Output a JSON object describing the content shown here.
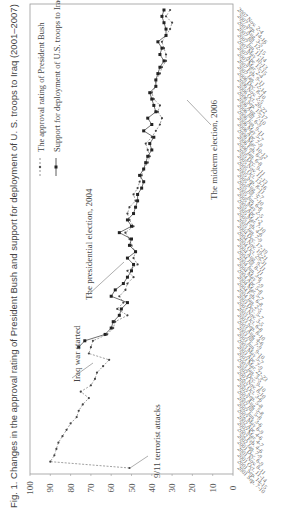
{
  "chart_data": {
    "type": "line",
    "title": "Fig. 1. Changes in the approval rating of President Bush and support for deployment of U. S. troops to Iraq (2001–2007)",
    "xlabel": "",
    "ylabel": "",
    "ylim": [
      0,
      100
    ],
    "yticks": [
      0,
      10,
      20,
      30,
      40,
      50,
      60,
      70,
      80,
      90,
      100
    ],
    "orientation": "rotated-90",
    "legend": [
      {
        "name": "The approval rating of President Bush",
        "style": "dashed-triangle"
      },
      {
        "name": "Support for deployment of U.S. troops to Iraq",
        "style": "solid-square"
      }
    ],
    "annotations": [
      {
        "text": "9/11 terrorist attacks",
        "index": 0
      },
      {
        "text": "Iraq war started",
        "index": 18
      },
      {
        "text": "The presidential election, 2004",
        "index": 36
      },
      {
        "text": "The midterm election, 2006",
        "index": 60
      }
    ],
    "categories": [
      "2001 Sep. 7-10",
      "2001 Sep. 14-15",
      "2001 Oct. 11-14",
      "2001 Nov. 8-11",
      "2001 Dec. 6-9",
      "2002 Jan. 7-9",
      "2002 Feb. 4-6",
      "2002 Mar. 4-7",
      "2002 Apr. 4-6",
      "2002 May 6-9",
      "2002 Jun. 3-6",
      "2002 Jul. 5-8",
      "2002 Aug. 5-8",
      "2002 Sep. 5-8",
      "2002 Oct. 3-6",
      "2002 Nov. 8-10",
      "2002 Dec. 9-10",
      "2003 Jan. 3-5",
      "2003 Mar. 22-23",
      "2003 Apr. 7-9",
      "2003 May 5-7",
      "2003 Jun. 9-10",
      "2003 Jul. 7-9",
      "2003 Aug. 4-6",
      "2003 Sep. 8-10",
      "2003 Oct. 6-8",
      "2003 Nov. 3-5",
      "2003 Dec. 5-7",
      "2004 Jan. 2-5",
      "2004 Feb. 6-8",
      "2004 Mar. 5-7",
      "2004 Apr. 5-8",
      "2004 May 7-9",
      "2004 Jun. 3-6",
      "2004 Jul. 8-11",
      "2004 Aug. 9-11",
      "2004 Oct. 29-31",
      "2004 Nov. 19-21",
      "2004 Dec. 17-19",
      "2005 Jan. 7-9",
      "2005 Feb. 4-6",
      "2005 Mar. 7-10",
      "2005 Apr. 1-2",
      "2005 May 2-5",
      "2005 Jun. 6-8",
      "2005 Jul. 7-10",
      "2005 Aug. 5-7",
      "2005 Sep. 8-11",
      "2005 Oct. 13-16",
      "2005 Nov. 11-13",
      "2005 Dec. 9-11",
      "2006 Jan. 6-8",
      "2006 Feb. 6-9",
      "2006 Mar. 10-12",
      "2006 Apr. 7-9",
      "2006 May 5-7",
      "2006 Jun. 9-11",
      "2006 Jul. 6-9",
      "2006 Aug. 7-10",
      "2006 Sep. 15-17",
      "2006 Oct. 20-22",
      "2006 Nov. 2-5",
      "2006 Dec. 8-10",
      "2007 Jan. 12-14",
      "2007 Feb. 9-11",
      "2007 Mar. 2-4",
      "2007 Apr. 13-15",
      "2007 May 10-13",
      "2007 Jun. 11-14",
      "2007 Jul. 12-15",
      "2007 Aug. 3-5",
      "2007 Sep. 14-16",
      "2007 Nov. 2-4"
    ],
    "series": [
      {
        "name": "The approval rating of President Bush",
        "values": [
          51,
          90,
          88,
          87,
          86,
          84,
          82,
          80,
          77,
          76,
          74,
          71,
          75,
          70,
          68,
          67,
          64,
          61,
          71,
          70,
          69,
          62,
          59,
          58,
          52,
          57,
          54,
          56,
          53,
          52,
          49,
          52,
          47,
          49,
          48,
          50,
          51,
          53,
          49,
          51,
          52,
          51,
          48,
          49,
          47,
          46,
          45,
          44,
          42,
          41,
          42,
          43,
          40,
          38,
          36,
          35,
          37,
          36,
          39,
          40,
          38,
          38,
          36,
          35,
          33,
          33,
          34,
          35,
          33,
          31,
          30,
          33,
          31
        ]
      },
      {
        "name": "Support for deployment of U.S. troops to Iraq",
        "values": [
          null,
          null,
          null,
          null,
          null,
          null,
          null,
          null,
          null,
          null,
          null,
          null,
          null,
          null,
          null,
          null,
          null,
          null,
          null,
          76,
          73,
          63,
          60,
          59,
          56,
          55,
          52,
          60,
          58,
          54,
          52,
          50,
          49,
          52,
          48,
          51,
          50,
          56,
          50,
          52,
          49,
          48,
          47,
          47,
          45,
          44,
          46,
          44,
          43,
          42,
          40,
          41,
          39,
          44,
          40,
          42,
          38,
          39,
          40,
          41,
          38,
          38,
          37,
          36,
          34,
          36,
          35,
          37,
          33,
          33,
          34,
          35,
          34
        ]
      }
    ]
  },
  "figure": {
    "title": "Fig. 1. Changes in the approval rating of President Bush and support for deployment of U. S. troops to Iraq (2001–2007)",
    "legend_approval": "The approval rating of President Bush",
    "legend_support": "Support for deployment of U.S. troops to Iraq",
    "ann_911": "9/11 terrorist attacks",
    "ann_iraq": "Iraq war started",
    "ann_pres": "The presidential election, 2004",
    "ann_mid": "The midterm election, 2006"
  }
}
